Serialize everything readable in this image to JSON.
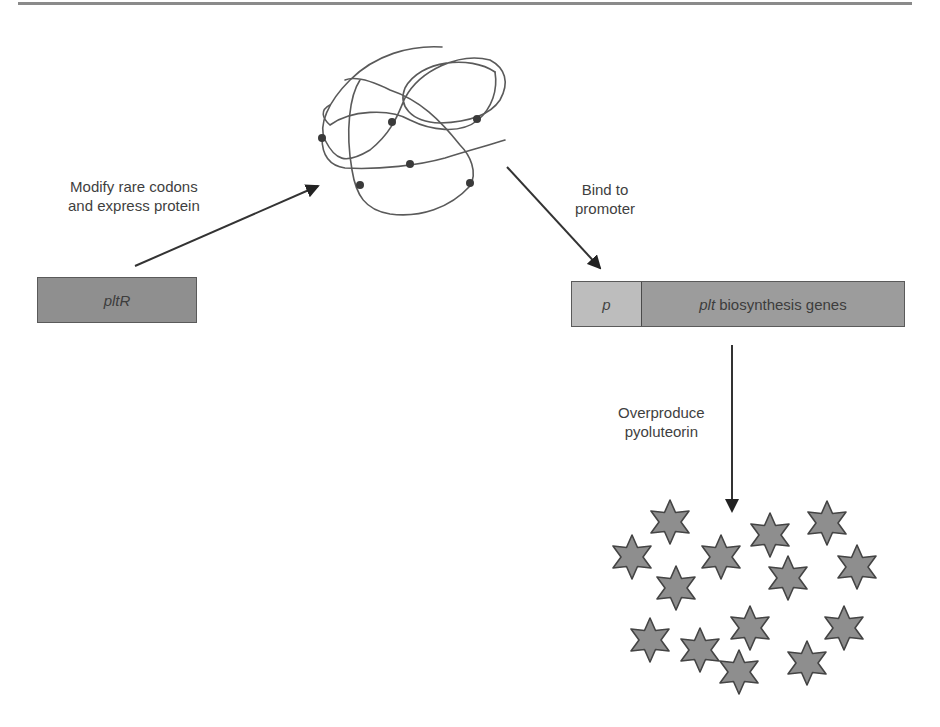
{
  "figure": {
    "labels": {
      "modify": [
        "Modify rare codons",
        "and express protein"
      ],
      "bind": [
        "Bind to",
        "promoter"
      ],
      "overproduce": [
        "Overproduce",
        "pyoluteorin"
      ]
    },
    "genes": {
      "regulator": "pltR",
      "promoter": "p",
      "operon_italic": "plt",
      "operon_rest": "biosynthesis genes"
    },
    "protein": {
      "description": "tangled polypeptide chain with 6 marked residues (modified rare codons)",
      "dot_count": 6
    },
    "product": {
      "shape": "six-pointed star",
      "count": 14
    },
    "colors": {
      "regulator_box": "#8f8f8f",
      "promoter_box": "#bdbdbd",
      "operon_box": "#9c9c9c",
      "star_fill": "#8e8e8e",
      "line": "#333333"
    }
  }
}
